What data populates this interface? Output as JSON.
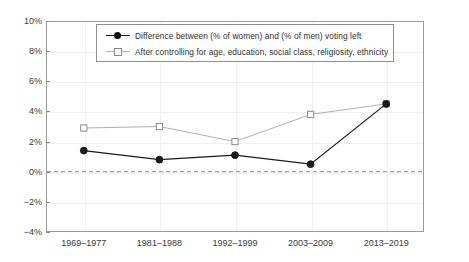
{
  "chart_data": {
    "type": "line",
    "title": "",
    "xlabel": "",
    "ylabel": "",
    "categories": [
      "1969–1977",
      "1981–1988",
      "1992–1999",
      "2003–2009",
      "2013–2019"
    ],
    "ylim": [
      -4,
      10
    ],
    "yticks": [
      "10%",
      "8%",
      "6%",
      "4%",
      "2%",
      "0%",
      "−2%",
      "−4%"
    ],
    "ytick_values": [
      10,
      8,
      6,
      4,
      2,
      0,
      -2,
      -4
    ],
    "grid": true,
    "legend_position": "top-center",
    "zero_reference_line": 0,
    "series": [
      {
        "name": "Difference between (% of women) and (% of men) voting left",
        "values": [
          1.4,
          0.8,
          1.1,
          0.5,
          4.5
        ],
        "marker": "filled-circle",
        "color": "#1a1a1a"
      },
      {
        "name": "After controlling for age, education, social class, religiosity, ethnicity",
        "values": [
          2.9,
          3.0,
          2.0,
          3.8,
          4.5
        ],
        "marker": "open-square",
        "color": "#b0b0b0"
      }
    ]
  },
  "legend": {
    "items": [
      {
        "label": "Difference between (% of women) and (% of men) voting left"
      },
      {
        "label": "After controlling for age, education, social class, religiosity, ethnicity"
      }
    ]
  },
  "colors": {
    "series_1": "#1a1a1a",
    "series_2": "#b0b0b0",
    "frame": "#9a9a9a",
    "grid": "#efefef",
    "zero_line": "#8a8a8a",
    "background": "#ffffff"
  }
}
